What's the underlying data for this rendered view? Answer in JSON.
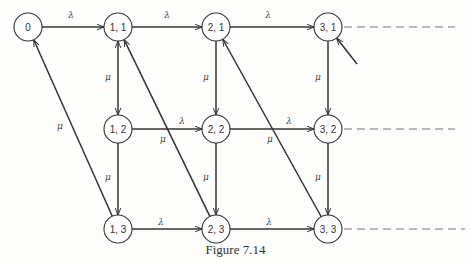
{
  "caption": "Figure 7.14",
  "colors": {
    "stroke": "#333333",
    "dashed": "#777777",
    "node_fill": "#ffffff"
  },
  "nodes": [
    {
      "id": "0",
      "label": "0",
      "x": 28,
      "y": 27
    },
    {
      "id": "1,1",
      "label": "1, 1",
      "x": 118,
      "y": 27
    },
    {
      "id": "2,1",
      "label": "2, 1",
      "x": 216,
      "y": 27
    },
    {
      "id": "3,1",
      "label": "3, 1",
      "x": 328,
      "y": 27
    },
    {
      "id": "1,2",
      "label": "1, 2",
      "x": 118,
      "y": 129
    },
    {
      "id": "2,2",
      "label": "2, 2",
      "x": 216,
      "y": 129
    },
    {
      "id": "3,2",
      "label": "3, 2",
      "x": 328,
      "y": 129
    },
    {
      "id": "1,3",
      "label": "1, 3",
      "x": 118,
      "y": 229
    },
    {
      "id": "2,3",
      "label": "2, 3",
      "x": 216,
      "y": 229
    },
    {
      "id": "3,3",
      "label": "3, 3",
      "x": 328,
      "y": 229
    }
  ],
  "edges": [
    {
      "from": "0",
      "to": "1,1",
      "label": "λ",
      "lx": 71,
      "ly": 18
    },
    {
      "from": "1,1",
      "to": "2,1",
      "label": "λ",
      "lx": 167,
      "ly": 18
    },
    {
      "from": "2,1",
      "to": "3,1",
      "label": "λ",
      "lx": 268,
      "ly": 18
    },
    {
      "from": "1,2",
      "to": "2,2",
      "label": "λ",
      "lx": 182,
      "ly": 124
    },
    {
      "from": "2,2",
      "to": "3,2",
      "label": "λ",
      "lx": 289,
      "ly": 124
    },
    {
      "from": "1,3",
      "to": "2,3",
      "label": "λ",
      "lx": 161,
      "ly": 225
    },
    {
      "from": "2,3",
      "to": "3,3",
      "label": "λ",
      "lx": 269,
      "ly": 225
    },
    {
      "from": "1,1",
      "to": "1,2",
      "label": "μ",
      "lx": 108,
      "ly": 80,
      "bidirectional": true
    },
    {
      "from": "1,2",
      "to": "1,3",
      "label": "μ",
      "lx": 108,
      "ly": 180
    },
    {
      "from": "2,1",
      "to": "2,2",
      "label": "μ",
      "lx": 206,
      "ly": 80
    },
    {
      "from": "2,2",
      "to": "2,3",
      "label": "μ",
      "lx": 206,
      "ly": 180
    },
    {
      "from": "3,1",
      "to": "3,2",
      "label": "μ",
      "lx": 318,
      "ly": 80
    },
    {
      "from": "3,2",
      "to": "3,3",
      "label": "μ",
      "lx": 318,
      "ly": 180
    },
    {
      "from": "1,3",
      "to": "0",
      "label": "μ",
      "lx": 60,
      "ly": 129
    },
    {
      "from": "2,3",
      "to": "1,1",
      "label": "μ",
      "lx": 163,
      "ly": 142
    },
    {
      "from": "3,3",
      "to": "2,1",
      "label": "μ",
      "lx": 270,
      "ly": 142
    }
  ],
  "incoming_stub": {
    "to": "3,1",
    "from_x": 357,
    "from_y": 64
  },
  "continuations": [
    {
      "from": "3,1",
      "to_x": 455
    },
    {
      "from": "3,2",
      "to_x": 455
    },
    {
      "from": "3,3",
      "to_x": 465
    }
  ]
}
